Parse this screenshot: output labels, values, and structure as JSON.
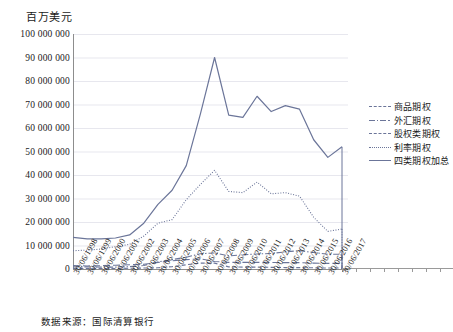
{
  "unit_title": "百万美元",
  "source_note": "数据来源：国际清算银行",
  "axis": {
    "y_ticks": [
      "0",
      "10 000 000",
      "20 000 000",
      "30 000 000",
      "40 000 000",
      "50 000 000",
      "60 000 000",
      "70 000 000",
      "80 000 000",
      "90 000 000",
      "100 000 000"
    ],
    "x_ticks": [
      "30/06/1998",
      "30/06/1999",
      "30/06/2000",
      "30/06/2001",
      "30/06/2002",
      "30/06/2003",
      "30/06/2004",
      "30/06/2005",
      "30/06/2006",
      "30/06/2007",
      "30/06/2008",
      "30/06/2009",
      "30/06/2010",
      "30/06/2011",
      "30/06/2012",
      "30/06/2013",
      "30/06/2014",
      "30/06/2015",
      "30/06/2016",
      "30/06/2017"
    ]
  },
  "legend": {
    "items": [
      {
        "label": "商品期权",
        "style": "dashed",
        "color": "#6b7599"
      },
      {
        "label": "外汇期权",
        "style": "dashdot",
        "color": "#6b7599"
      },
      {
        "label": "股权类期权",
        "style": "longdash",
        "color": "#6b7599"
      },
      {
        "label": "利率期权",
        "style": "dotted",
        "color": "#6b7599"
      },
      {
        "label": "四类期权加总",
        "style": "solid",
        "color": "#6b7599"
      }
    ]
  },
  "chart_data": {
    "type": "line",
    "title": "百万美元",
    "xlabel": "",
    "ylabel": "百万美元",
    "ylim": [
      0,
      100000000
    ],
    "xlim": [
      "30/06/1998",
      "30/06/2017"
    ],
    "grid": true,
    "legend_position": "right",
    "categories": [
      "30/06/1998",
      "30/06/1999",
      "30/06/2000",
      "30/06/2001",
      "30/06/2002",
      "30/06/2003",
      "30/06/2004",
      "30/06/2005",
      "30/06/2006",
      "30/06/2007",
      "30/06/2008",
      "30/06/2009",
      "30/06/2010",
      "30/06/2011",
      "30/06/2012",
      "30/06/2013",
      "30/06/2014",
      "30/06/2015",
      "30/06/2016",
      "30/06/2017"
    ],
    "series": [
      {
        "name": "四类期权加总",
        "style": "solid",
        "color": "#6b7599",
        "values": [
          13500000,
          12800000,
          12800000,
          13200000,
          14500000,
          19500000,
          27500000,
          33500000,
          44000000,
          66000000,
          90000000,
          65500000,
          64500000,
          73500000,
          67000000,
          69500000,
          68000000,
          55000000,
          47500000,
          52000000
        ]
      },
      {
        "name": "利率期权",
        "style": "dotted",
        "color": "#6b7599",
        "values": [
          7800000,
          8000000,
          8500000,
          9500000,
          10500000,
          14000000,
          19500000,
          21000000,
          29500000,
          36000000,
          42000000,
          33000000,
          32500000,
          37000000,
          32000000,
          32500000,
          31000000,
          22000000,
          16000000,
          17000000
        ]
      },
      {
        "name": "股权类期权",
        "style": "longdash",
        "color": "#6b7599",
        "values": [
          1500000,
          1300000,
          1400000,
          1600000,
          1800000,
          2000000,
          2800000,
          3500000,
          4000000,
          4300000,
          3200000,
          2800000,
          2800000,
          2800000,
          2800000,
          2700000,
          2700000,
          2500000,
          2400000,
          2400000
        ]
      },
      {
        "name": "外汇期权",
        "style": "dashdot",
        "color": "#6b7599",
        "values": [
          900000,
          900000,
          800000,
          800000,
          1000000,
          1500000,
          3000000,
          4000000,
          5000000,
          6500000,
          6800000,
          5600000,
          6000000,
          6400000,
          6600000,
          7300000,
          7800000,
          7000000,
          6300000,
          6300000
        ]
      },
      {
        "name": "商品期权",
        "style": "dashed",
        "color": "#6b7599",
        "values": [
          200000,
          200000,
          200000,
          200000,
          300000,
          400000,
          500000,
          1000000,
          1800000,
          2500000,
          2500000,
          900000,
          800000,
          800000,
          700000,
          600000,
          600000,
          500000,
          400000,
          400000
        ]
      }
    ]
  }
}
